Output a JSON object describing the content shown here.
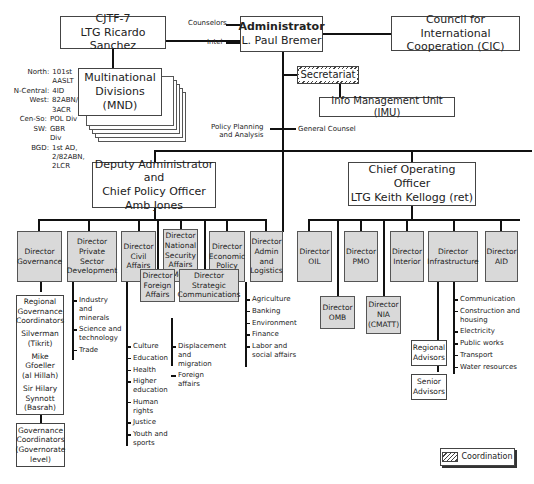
{
  "top": {
    "cjtf": {
      "line1": "CJTF-7",
      "line2": "LTG Ricardo Sanchez"
    },
    "administrator": {
      "title": "Administrator",
      "name": "L. Paul Bremer"
    },
    "cic": {
      "line1": "Council for International",
      "line2": "Cooperation (CIC)"
    },
    "counselors": "Counselors",
    "intel": "Intel",
    "secretariat": "Secretariat",
    "imu": "Info Management Unit (IMU)",
    "policy_planning": [
      "Policy Planning",
      "and Analysis"
    ],
    "general_counsel": "General Counsel"
  },
  "mnd": {
    "title": [
      "Multinational",
      "Divisions",
      "(MND)"
    ],
    "regions": [
      {
        "region": "North:",
        "unit": "101st AASLT"
      },
      {
        "region": "N-Central:",
        "unit": "4ID"
      },
      {
        "region": "West:",
        "unit": "82ABN/ 3ACR"
      },
      {
        "region": "Cen-So:",
        "unit": "POL Div"
      },
      {
        "region": "SW:",
        "unit": "GBR Div"
      },
      {
        "region": "BGD:",
        "unit": "1st AD, 2/82ABN, 2LCR"
      }
    ]
  },
  "deputy": {
    "line1": "Deputy Administrator and",
    "line2": "Chief Policy Officer",
    "line3": "Amb Jones"
  },
  "coo": {
    "line1": "Chief Operating Officer",
    "line2": "LTG Keith Kellogg (ret)"
  },
  "deputy_directors": [
    {
      "label": "Director Governance"
    },
    {
      "label": "Director Private Sector Development"
    },
    {
      "label": "Director Civil Affairs"
    },
    {
      "label": "Director National Security Affairs (MoD)"
    },
    {
      "label": "Director Economic Policy"
    },
    {
      "label": "Director Admin and Logistics"
    },
    {
      "label": "Director Foreign Affairs"
    },
    {
      "label": "Director Strategic Communications"
    }
  ],
  "coo_directors": [
    {
      "label": "Director OIL"
    },
    {
      "label": "Director PMO"
    },
    {
      "label": "Director Interior"
    },
    {
      "label": "Director Infrastructure"
    },
    {
      "label": "Director AID"
    },
    {
      "label": "Director OMB"
    },
    {
      "label": "Director NIA (CMATT)"
    }
  ],
  "governance": {
    "regional": [
      "Regional",
      "Governance",
      "Coordinators",
      "Silverman",
      "(Tikrit)",
      "Mike",
      "Gfoeller",
      "(al Hillah)",
      "Sir Hilary",
      "Synnott",
      "(Basrah)"
    ],
    "coordinators": [
      "Governance",
      "Coordinators",
      "(Governorate",
      "level)"
    ]
  },
  "private_sector_items": [
    "Industry and minerals",
    "Science and technology",
    "Trade"
  ],
  "civil_affairs_items": [
    "Culture",
    "Education",
    "Health",
    "Higher education",
    "Human rights",
    "Justice",
    "Youth and sports"
  ],
  "foreign_affairs_items": [
    "Displacement and migration",
    "Foreign affairs"
  ],
  "economic_items": [
    "Agriculture",
    "Banking",
    "Environment",
    "Finance",
    "Labor and social affairs"
  ],
  "infrastructure_items": [
    "Communication",
    "Construction and housing",
    "Electricity",
    "Public works",
    "Transport",
    "Water resources"
  ],
  "advisors": {
    "regional": "Regional Advisors",
    "senior": "Senior Advisors"
  },
  "legend": {
    "label": "Coordination"
  }
}
